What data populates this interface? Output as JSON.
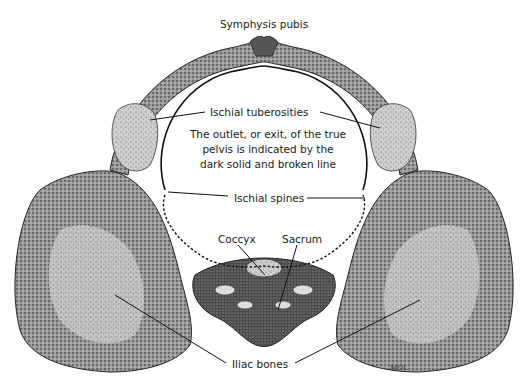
{
  "figure": {
    "labels": {
      "symphysis_pubis": "Symphysis pubis",
      "ischial_tuberosities": "Ischial tuberosities",
      "ischial_spines": "Ischial spines",
      "coccyx": "Coccyx",
      "sacrum": "Sacrum",
      "iliac_bones": "Iliac bones"
    },
    "caption_lines": [
      "The outlet, or exit, of the true",
      "pelvis is indicated by the",
      "dark solid and broken line"
    ],
    "signature": "MOL",
    "colors": {
      "background": "#ffffff",
      "ink": "#1a1a1a",
      "bone_dark": "#3a3a3a",
      "bone_mid": "#8a8a8a",
      "bone_light": "#d6d6d6"
    }
  }
}
